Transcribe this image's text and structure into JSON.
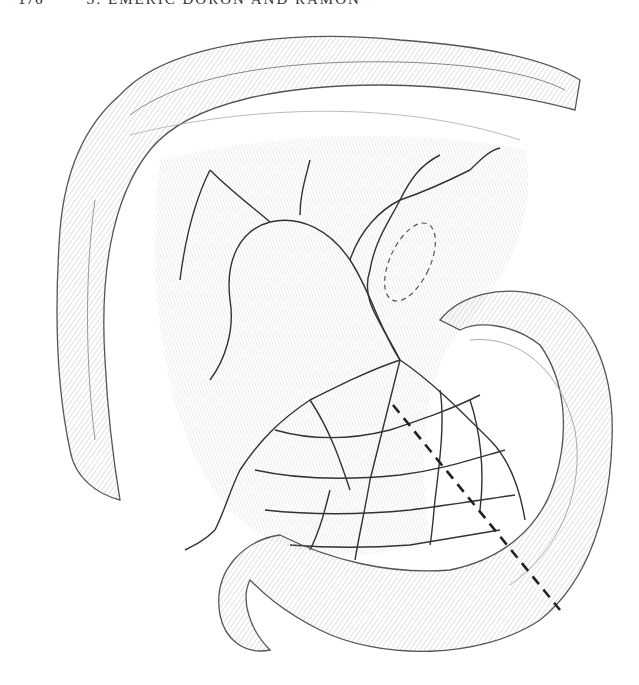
{
  "header": {
    "page_number": "176",
    "running_title": "S. EMERIC DORON AND RAMON"
  },
  "figure": {
    "annotations": [
      {
        "type": "dashed-ellipse",
        "label": "mesenteric-window"
      },
      {
        "type": "dashed-line",
        "label": "resection-line"
      }
    ],
    "colors": {
      "ink": "#333333",
      "shade": "#9a9a9a",
      "paper": "#ffffff"
    }
  }
}
